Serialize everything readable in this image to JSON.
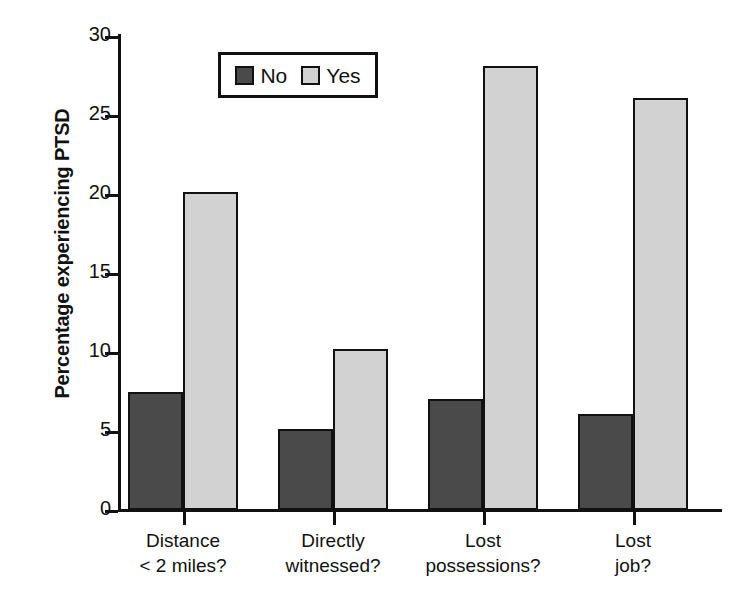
{
  "chart_data": {
    "type": "bar",
    "title": "",
    "subtitle": "",
    "xlabel": "",
    "ylabel": "Percentage experiencing PTSD",
    "ylim": [
      0,
      30
    ],
    "ytick_labels": [
      "0",
      "5",
      "10",
      "15",
      "20",
      "25",
      "30"
    ],
    "ytick_values": [
      0,
      5,
      10,
      15,
      20,
      25,
      30
    ],
    "grid": false,
    "legend_position": "top-center",
    "categories": [
      "Distance\n< 2 miles?",
      "Directly\nwitnessed?",
      "Lost\npossessions?",
      "Lost\njob?"
    ],
    "series": [
      {
        "name": "No",
        "color": "#4a4a4a",
        "values": [
          7.5,
          5.1,
          7.0,
          6.1
        ]
      },
      {
        "name": "Yes",
        "color": "#d2d2d2",
        "values": [
          20.1,
          10.2,
          28.1,
          26.1
        ]
      }
    ]
  },
  "legend": {
    "entries": [
      {
        "label": "No"
      },
      {
        "label": "Yes"
      }
    ]
  },
  "colors": {
    "no": "#4a4a4a",
    "yes": "#d2d2d2",
    "axis": "#111111",
    "background": "#ffffff"
  }
}
